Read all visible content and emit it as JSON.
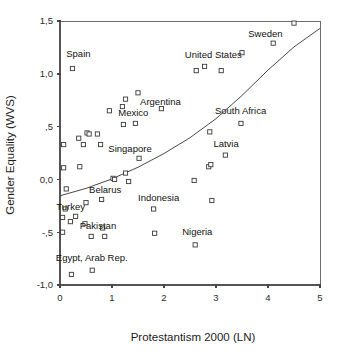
{
  "chart_data": {
    "type": "scatter",
    "title": "",
    "xlabel": "Protestantism 2000 (LN)",
    "ylabel": "Gender Equality (WVS)",
    "xlim": [
      0,
      5
    ],
    "ylim": [
      -1.0,
      1.5
    ],
    "xticks": [
      0,
      1,
      2,
      3,
      4,
      5
    ],
    "xticklabels": [
      "0",
      "1",
      "2",
      "3",
      "4",
      "5"
    ],
    "yticks": [
      -1.0,
      -0.5,
      0.0,
      0.5,
      1.0,
      1.5
    ],
    "yticklabels": [
      "-1,0",
      "-,5",
      "0,0",
      ",5",
      "1,0",
      "1,5"
    ],
    "grid": false,
    "legend": null,
    "marker_style": "open-square",
    "points": [
      {
        "x": 0.05,
        "y": -0.5,
        "label": ""
      },
      {
        "x": 0.05,
        "y": -0.36,
        "label": ""
      },
      {
        "x": 0.07,
        "y": 0.11,
        "label": ""
      },
      {
        "x": 0.07,
        "y": 0.33,
        "label": ""
      },
      {
        "x": 0.1,
        "y": -0.28,
        "label": ""
      },
      {
        "x": 0.12,
        "y": -0.09,
        "label": ""
      },
      {
        "x": 0.24,
        "y": 1.05,
        "label": "Spain"
      },
      {
        "x": 0.22,
        "y": -0.9,
        "label": ""
      },
      {
        "x": 0.2,
        "y": -0.4,
        "label": ""
      },
      {
        "x": 0.3,
        "y": -0.35,
        "label": ""
      },
      {
        "x": 0.36,
        "y": 0.39,
        "label": ""
      },
      {
        "x": 0.38,
        "y": 0.12,
        "label": ""
      },
      {
        "x": 0.45,
        "y": 0.33,
        "label": ""
      },
      {
        "x": 0.52,
        "y": 0.44,
        "label": ""
      },
      {
        "x": 0.56,
        "y": 0.43,
        "label": ""
      },
      {
        "x": 0.5,
        "y": -0.22,
        "label": ""
      },
      {
        "x": 0.48,
        "y": -0.42,
        "label": ""
      },
      {
        "x": 0.6,
        "y": -0.54,
        "label": ""
      },
      {
        "x": 0.62,
        "y": -0.86,
        "label": ""
      },
      {
        "x": 0.72,
        "y": 0.43,
        "label": ""
      },
      {
        "x": 0.78,
        "y": 0.33,
        "label": ""
      },
      {
        "x": 0.8,
        "y": -0.19,
        "label": ""
      },
      {
        "x": 0.82,
        "y": -0.46,
        "label": "Pakistan"
      },
      {
        "x": 0.86,
        "y": -0.54,
        "label": ""
      },
      {
        "x": 0.95,
        "y": 0.65,
        "label": ""
      },
      {
        "x": 1.02,
        "y": 0.01,
        "label": ""
      },
      {
        "x": 1.05,
        "y": 0.0,
        "label": ""
      },
      {
        "x": 1.2,
        "y": 0.69,
        "label": ""
      },
      {
        "x": 1.22,
        "y": 0.52,
        "label": ""
      },
      {
        "x": 1.26,
        "y": 0.76,
        "label": ""
      },
      {
        "x": 1.26,
        "y": 0.06,
        "label": ""
      },
      {
        "x": 1.32,
        "y": -0.02,
        "label": ""
      },
      {
        "x": 1.45,
        "y": 0.53,
        "label": "Mexico"
      },
      {
        "x": 1.5,
        "y": 0.82,
        "label": "Argentina"
      },
      {
        "x": 1.52,
        "y": 0.2,
        "label": "Singapore"
      },
      {
        "x": 1.8,
        "y": -0.28,
        "label": "Indonesia"
      },
      {
        "x": 1.82,
        "y": -0.51,
        "label": ""
      },
      {
        "x": 1.95,
        "y": 0.67,
        "label": ""
      },
      {
        "x": 2.58,
        "y": -0.01,
        "label": ""
      },
      {
        "x": 2.6,
        "y": -0.62,
        "label": "Nigeria"
      },
      {
        "x": 2.62,
        "y": 1.03,
        "label": ""
      },
      {
        "x": 2.78,
        "y": 1.07,
        "label": "United States"
      },
      {
        "x": 2.88,
        "y": 0.45,
        "label": ""
      },
      {
        "x": 2.86,
        "y": 0.12,
        "label": ""
      },
      {
        "x": 2.9,
        "y": 0.14,
        "label": ""
      },
      {
        "x": 2.92,
        "y": -0.2,
        "label": ""
      },
      {
        "x": 3.1,
        "y": 1.03,
        "label": ""
      },
      {
        "x": 3.18,
        "y": 0.23,
        "label": "Latvia"
      },
      {
        "x": 3.5,
        "y": 1.2,
        "label": ""
      },
      {
        "x": 3.48,
        "y": 0.53,
        "label": "South Africa"
      },
      {
        "x": 4.1,
        "y": 1.29,
        "label": "Sweden"
      },
      {
        "x": 4.5,
        "y": 1.48,
        "label": ""
      }
    ],
    "annotations": [
      {
        "text": "Spain",
        "x": 0.12,
        "y": 1.16,
        "anchor": "start"
      },
      {
        "text": "Argentina",
        "x": 1.54,
        "y": 0.7,
        "anchor": "start"
      },
      {
        "text": "Mexico",
        "x": 1.12,
        "y": 0.6,
        "anchor": "start"
      },
      {
        "text": "Singapore",
        "x": 0.93,
        "y": 0.26,
        "anchor": "start"
      },
      {
        "text": "Belarus",
        "x": 0.56,
        "y": -0.13,
        "anchor": "start"
      },
      {
        "text": "Turkey",
        "x": -0.07,
        "y": -0.29,
        "anchor": "start"
      },
      {
        "text": "Pakistan",
        "x": 0.38,
        "y": -0.47,
        "anchor": "start"
      },
      {
        "text": "Egypt, Arab Rep.",
        "x": -0.08,
        "y": -0.77,
        "anchor": "start"
      },
      {
        "text": "Indonesia",
        "x": 1.5,
        "y": -0.2,
        "anchor": "start"
      },
      {
        "text": "Nigeria",
        "x": 2.35,
        "y": -0.53,
        "anchor": "start"
      },
      {
        "text": "United States",
        "x": 2.4,
        "y": 1.15,
        "anchor": "start"
      },
      {
        "text": "Sweden",
        "x": 3.62,
        "y": 1.35,
        "anchor": "start"
      },
      {
        "text": "South Africa",
        "x": 2.98,
        "y": 0.62,
        "anchor": "start"
      },
      {
        "text": "Latvia",
        "x": 2.95,
        "y": 0.31,
        "anchor": "start"
      }
    ],
    "fit_curve": {
      "name": "fitted-trend",
      "points": [
        {
          "x": 0.0,
          "y": -0.155
        },
        {
          "x": 0.5,
          "y": -0.085
        },
        {
          "x": 1.0,
          "y": 0.005
        },
        {
          "x": 1.5,
          "y": 0.115
        },
        {
          "x": 2.0,
          "y": 0.245
        },
        {
          "x": 2.5,
          "y": 0.395
        },
        {
          "x": 3.0,
          "y": 0.575
        },
        {
          "x": 3.5,
          "y": 0.795
        },
        {
          "x": 4.0,
          "y": 1.035
        },
        {
          "x": 4.5,
          "y": 1.255
        },
        {
          "x": 5.0,
          "y": 1.43
        }
      ]
    }
  },
  "geometry": {
    "plot_left": 60,
    "plot_right": 320,
    "plot_top": 21,
    "plot_bottom": 285
  }
}
